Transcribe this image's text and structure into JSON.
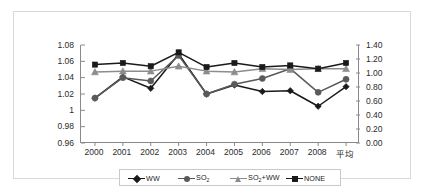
{
  "chart_data": {
    "type": "line",
    "title": "",
    "xlabel": "",
    "ylabel": "",
    "categories": [
      "2000",
      "2001",
      "2002",
      "2003",
      "2004",
      "2005",
      "2006",
      "2007",
      "2008",
      "平均"
    ],
    "y_left": {
      "ticks": [
        "1.08",
        "1.06",
        "1.04",
        "1.02",
        "1",
        "0.98",
        "0.96"
      ],
      "values": [
        1.08,
        1.06,
        1.04,
        1.02,
        1.0,
        0.98,
        0.96
      ],
      "min": 0.96,
      "max": 1.08
    },
    "y_right": {
      "ticks": [
        "1.40",
        "1.20",
        "1.00",
        "0.80",
        "0.60",
        "0.40",
        "0.20",
        "0.00"
      ],
      "values": [
        1.4,
        1.2,
        1.0,
        0.8,
        0.6,
        0.4,
        0.2,
        0.0
      ],
      "min": 0.0,
      "max": 1.4
    },
    "grid": false,
    "legend_position": "bottom",
    "series": [
      {
        "name": "WW",
        "label_html": "WW",
        "marker": "diamond",
        "color": "#1a1a1a",
        "axis": "left",
        "values": [
          1.015,
          1.041,
          1.027,
          1.069,
          1.02,
          1.031,
          1.023,
          1.024,
          1.005,
          1.029
        ]
      },
      {
        "name": "SO2",
        "label_html": "SO<sub>2</sub>",
        "marker": "circle",
        "color": "#5a5a5a",
        "axis": "left",
        "values": [
          1.015,
          1.04,
          1.036,
          1.067,
          1.02,
          1.032,
          1.039,
          1.051,
          1.022,
          1.038
        ]
      },
      {
        "name": "SO2+WW",
        "label_html": "SO<sub>2</sub>+WW",
        "marker": "triangle",
        "color": "#8c8c8c",
        "axis": "left",
        "values": [
          1.047,
          1.048,
          1.048,
          1.054,
          1.048,
          1.047,
          1.051,
          1.05,
          1.051,
          1.051
        ]
      },
      {
        "name": "NONE",
        "label_html": "NONE",
        "marker": "square",
        "color": "#1a1a1a",
        "axis": "left",
        "values": [
          1.056,
          1.058,
          1.054,
          1.071,
          1.053,
          1.058,
          1.053,
          1.055,
          1.051,
          1.058
        ]
      }
    ]
  },
  "legend": {
    "items": [
      {
        "label": "WW",
        "marker": "diamond",
        "color": "#1a1a1a"
      },
      {
        "label": "SO2",
        "marker": "circle",
        "color": "#5a5a5a"
      },
      {
        "label": "SO2+WW",
        "marker": "triangle",
        "color": "#8c8c8c"
      },
      {
        "label": "NONE",
        "marker": "square",
        "color": "#1a1a1a"
      }
    ]
  },
  "colors": {
    "axis": "#8a8a8a",
    "frame": "#d8d8d8",
    "text": "#2b2b2b",
    "background": "#ffffff"
  }
}
